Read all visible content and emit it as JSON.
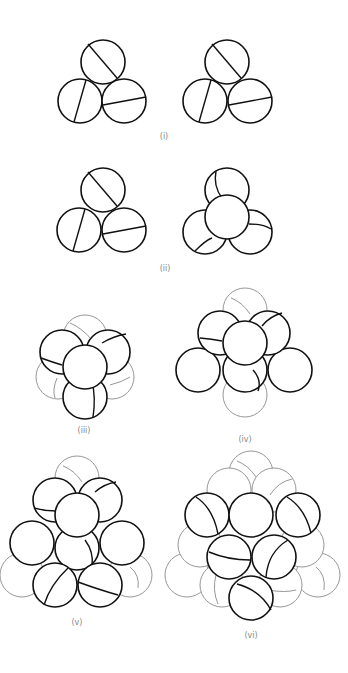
{
  "figure": {
    "panels": [
      {
        "id": "i",
        "label": "(i)"
      },
      {
        "id": "ii",
        "label": "(ii)"
      },
      {
        "id": "iii",
        "label": "(iii)"
      },
      {
        "id": "iv",
        "label": "(iv)"
      },
      {
        "id": "v",
        "label": "(v)"
      },
      {
        "id": "vi",
        "label": "(vi)"
      }
    ],
    "colors": {
      "line": "#111111",
      "hidden_line": "#8a8a8a",
      "background": "#ffffff"
    }
  }
}
